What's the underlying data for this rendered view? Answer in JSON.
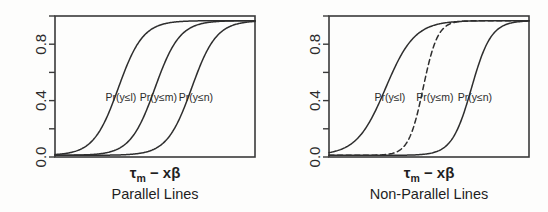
{
  "figure": {
    "background_color": "#fdfdfc",
    "line_color": "#2e2e2e",
    "axis_color": "#3a3a3a"
  },
  "chart_data": [
    {
      "type": "line",
      "panel_id": "left",
      "title": "Parallel Lines",
      "xlabel": "τm − xβ",
      "xlabel_base": "τ",
      "xlabel_sub": "m",
      "xlabel_rest": " − xβ",
      "ylabel": "",
      "xlim": [
        -6,
        6
      ],
      "ylim": [
        0,
        1
      ],
      "grid": false,
      "legend": "inline-annotations",
      "yticks": [
        0.0,
        0.2,
        0.4,
        0.6,
        0.8,
        1.0
      ],
      "ytick_labels": [
        "0.0",
        "",
        "0.4",
        "",
        "0.8",
        ""
      ],
      "xticks": [],
      "xtick_labels": [],
      "series": [
        {
          "name": "Pr(y≤l)",
          "shape": "logistic",
          "midpoint": -2.2,
          "slope": 1.35,
          "style": "solid",
          "label": "Pr(y≤l)",
          "label_x": -2.05,
          "label_y": 0.4
        },
        {
          "name": "Pr(y≤m)",
          "shape": "logistic",
          "midpoint": 0.0,
          "slope": 1.35,
          "style": "solid",
          "label": "Pr(y≤m)",
          "label_x": 0.2,
          "label_y": 0.4
        },
        {
          "name": "Pr(y≤n)",
          "shape": "logistic",
          "midpoint": 2.2,
          "slope": 1.35,
          "style": "solid",
          "label": "Pr(y≤n)",
          "label_x": 2.45,
          "label_y": 0.4
        }
      ]
    },
    {
      "type": "line",
      "panel_id": "right",
      "title": "Non-Parallel Lines",
      "xlabel": "τm − xβ",
      "xlabel_base": "τ",
      "xlabel_sub": "m",
      "xlabel_rest": " − xβ",
      "ylabel": "",
      "xlim": [
        -6,
        6
      ],
      "ylim": [
        0,
        1
      ],
      "grid": false,
      "legend": "inline-annotations",
      "yticks": [
        0.0,
        0.2,
        0.4,
        0.6,
        0.8,
        1.0
      ],
      "ytick_labels": [
        "0.0",
        "",
        "0.4",
        "",
        "0.8",
        ""
      ],
      "xticks": [],
      "xtick_labels": [],
      "series": [
        {
          "name": "Pr(y≤l)",
          "shape": "logistic",
          "midpoint": -2.6,
          "slope": 1.15,
          "style": "solid",
          "label": "Pr(y≤l)",
          "label_x": -2.35,
          "label_y": 0.4
        },
        {
          "name": "Pr(y≤m)",
          "shape": "logistic",
          "midpoint": -0.35,
          "slope": 2.3,
          "style": "dashed",
          "label": "Pr(y≤m)",
          "label_x": 0.35,
          "label_y": 0.4
        },
        {
          "name": "Pr(y≤n)",
          "shape": "logistic",
          "midpoint": 2.55,
          "slope": 1.7,
          "style": "solid",
          "label": "Pr(y≤n)",
          "label_x": 2.75,
          "label_y": 0.4
        }
      ]
    }
  ]
}
